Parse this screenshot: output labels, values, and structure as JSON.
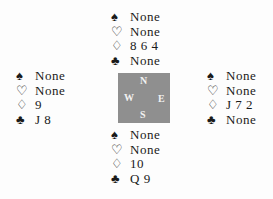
{
  "suits": {
    "spades": "♠",
    "hearts": "♡",
    "diamonds": "♢",
    "clubs": "♣"
  },
  "compass": {
    "north": "N",
    "west": "W",
    "east": "E",
    "south": "S",
    "background": "#8f8f8f"
  },
  "hands": {
    "north": {
      "spades": "None",
      "hearts": "None",
      "diamonds": "8 6 4",
      "clubs": "None"
    },
    "west": {
      "spades": "None",
      "hearts": "None",
      "diamonds": "9",
      "clubs": "J 8"
    },
    "east": {
      "spades": "None",
      "hearts": "None",
      "diamonds": "J 7 2",
      "clubs": "None"
    },
    "south": {
      "spades": "None",
      "hearts": "None",
      "diamonds": "10",
      "clubs": "Q 9"
    }
  }
}
